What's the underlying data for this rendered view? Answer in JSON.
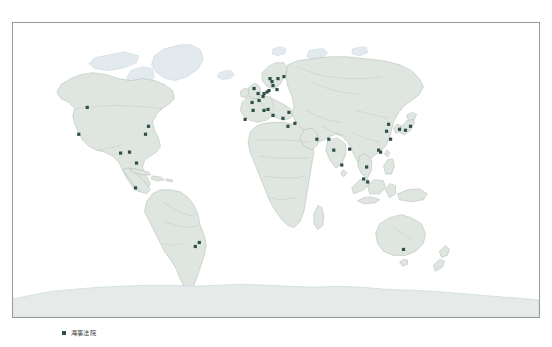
{
  "figure": {
    "kind": "world-map",
    "background_color": "#ffffff"
  },
  "map": {
    "projection": "miller-cylindrical",
    "frame": {
      "x": 12,
      "y": 22,
      "width": 528,
      "height": 296
    },
    "colors": {
      "ocean": "#ffffff",
      "land": "#dfe5df",
      "land_stroke": "#a8b2ad",
      "border_stroke": "#b9bfba",
      "coast_polar": "#b9cfdd",
      "antarctica": "#e6eae8",
      "frame_stroke": "#9a9a9a",
      "marker": "#2f4f4a"
    },
    "graticule": false,
    "marker_shape": "square",
    "marker_size_px": 3.2,
    "markers": [
      {
        "name": "Seattle",
        "x": 74.5,
        "y": 85.0
      },
      {
        "name": "Los Angeles",
        "x": 66.0,
        "y": 112.0
      },
      {
        "name": "Houston",
        "x": 108.0,
        "y": 131.0
      },
      {
        "name": "New Orleans",
        "x": 117.0,
        "y": 130.0
      },
      {
        "name": "Miami",
        "x": 124.0,
        "y": 141.0
      },
      {
        "name": "New York",
        "x": 136.0,
        "y": 104.0
      },
      {
        "name": "Norfolk",
        "x": 133.0,
        "y": 112.0
      },
      {
        "name": "Panama",
        "x": 123.0,
        "y": 166.0
      },
      {
        "name": "Santos",
        "x": 183.0,
        "y": 225.0
      },
      {
        "name": "Rio de Janeiro",
        "x": 187.0,
        "y": 221.0
      },
      {
        "name": "Lisbon",
        "x": 233.0,
        "y": 97.0
      },
      {
        "name": "Bilbao",
        "x": 241.0,
        "y": 88.0
      },
      {
        "name": "Le Havre",
        "x": 247.0,
        "y": 78.0
      },
      {
        "name": "Brest",
        "x": 240.0,
        "y": 80.0
      },
      {
        "name": "Antwerp",
        "x": 251.0,
        "y": 74.0
      },
      {
        "name": "Rotterdam",
        "x": 252.0,
        "y": 71.0
      },
      {
        "name": "London",
        "x": 246.0,
        "y": 71.0
      },
      {
        "name": "Liverpool",
        "x": 242.0,
        "y": 66.0
      },
      {
        "name": "Hamburg",
        "x": 257.0,
        "y": 68.0
      },
      {
        "name": "Bremen",
        "x": 255.0,
        "y": 69.5
      },
      {
        "name": "Copenhagen",
        "x": 261.0,
        "y": 63.0
      },
      {
        "name": "Oslo",
        "x": 258.0,
        "y": 56.0
      },
      {
        "name": "Gothenburg",
        "x": 260.0,
        "y": 59.0
      },
      {
        "name": "Stockholm",
        "x": 266.0,
        "y": 56.0
      },
      {
        "name": "Helsinki",
        "x": 272.0,
        "y": 54.0
      },
      {
        "name": "Gdansk",
        "x": 265.0,
        "y": 67.0
      },
      {
        "name": "Marseille",
        "x": 252.0,
        "y": 88.0
      },
      {
        "name": "Genoa",
        "x": 256.0,
        "y": 87.0
      },
      {
        "name": "Naples",
        "x": 261.0,
        "y": 93.0
      },
      {
        "name": "Piraeus",
        "x": 271.0,
        "y": 96.0
      },
      {
        "name": "Istanbul",
        "x": 277.0,
        "y": 90.0
      },
      {
        "name": "Alexandria",
        "x": 276.0,
        "y": 104.0
      },
      {
        "name": "Beirut",
        "x": 283.0,
        "y": 101.0
      },
      {
        "name": "Dubai",
        "x": 305.0,
        "y": 117.0
      },
      {
        "name": "Karachi",
        "x": 317.0,
        "y": 117.0
      },
      {
        "name": "Mumbai",
        "x": 322.0,
        "y": 128.0
      },
      {
        "name": "Chennai",
        "x": 330.0,
        "y": 143.0
      },
      {
        "name": "Kolkata",
        "x": 338.0,
        "y": 127.0
      },
      {
        "name": "Bangkok",
        "x": 355.0,
        "y": 145.0
      },
      {
        "name": "Singapore",
        "x": 356.0,
        "y": 160.0
      },
      {
        "name": "Port Klang",
        "x": 352.0,
        "y": 157.0
      },
      {
        "name": "Hong Kong",
        "x": 369.0,
        "y": 130.0
      },
      {
        "name": "Guangzhou",
        "x": 367.0,
        "y": 128.0
      },
      {
        "name": "Shanghai",
        "x": 379.0,
        "y": 117.0
      },
      {
        "name": "Qingdao",
        "x": 375.0,
        "y": 109.0
      },
      {
        "name": "Dalian",
        "x": 377.0,
        "y": 102.0
      },
      {
        "name": "Busan",
        "x": 388.0,
        "y": 107.0
      },
      {
        "name": "Osaka",
        "x": 394.0,
        "y": 108.0
      },
      {
        "name": "Tokyo",
        "x": 399.0,
        "y": 104.0
      },
      {
        "name": "Melbourne",
        "x": 392.0,
        "y": 228.0
      }
    ]
  },
  "legend": {
    "label": "海事法院",
    "marker_color": "#2f4f4a"
  }
}
